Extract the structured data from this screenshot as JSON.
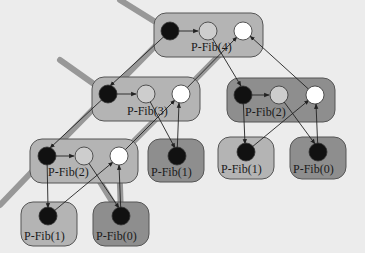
{
  "diagram": {
    "colors": {
      "background": "#ececec",
      "box_light": "#b4b4b4",
      "box_dark": "#8e8e8e",
      "box_stroke": "#555555",
      "strand_black": "#111111",
      "strand_gray": "#cdcdcd",
      "strand_white": "#ffffff",
      "edge": "#222222",
      "critical_path": "#8a8a8a"
    },
    "nodes": [
      {
        "id": "fib4",
        "label": "P-Fib(4)",
        "shade": "light"
      },
      {
        "id": "fib3",
        "label": "P-Fib(3)",
        "shade": "light"
      },
      {
        "id": "fib2a",
        "label": "P-Fib(2)",
        "shade": "dark"
      },
      {
        "id": "fib2b",
        "label": "P-Fib(2)",
        "shade": "light"
      },
      {
        "id": "fib1a",
        "label": "P-Fib(1)",
        "shade": "dark"
      },
      {
        "id": "fib1b",
        "label": "P-Fib(1)",
        "shade": "light"
      },
      {
        "id": "fib0a",
        "label": "P-Fib(0)",
        "shade": "dark"
      },
      {
        "id": "fib1c",
        "label": "P-Fib(1)",
        "shade": "light"
      },
      {
        "id": "fib0b",
        "label": "P-Fib(0)",
        "shade": "dark"
      }
    ]
  }
}
